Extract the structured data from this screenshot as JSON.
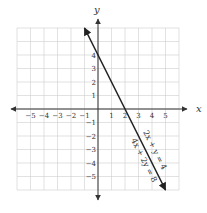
{
  "chart_data": {
    "type": "line",
    "title": "",
    "xlabel": "x",
    "ylabel": "y",
    "xlim": [
      -6,
      6
    ],
    "ylim": [
      -6,
      6
    ],
    "grid": true,
    "x_ticks": [
      -5,
      -4,
      -3,
      -2,
      -1,
      1,
      2,
      3,
      4,
      5
    ],
    "y_ticks": [
      -5,
      -4,
      -3,
      -2,
      -1,
      1,
      2,
      3,
      4
    ],
    "x_tick_labels": [
      "−5",
      "−4",
      "−3",
      "−2",
      "−1",
      "1",
      "2",
      "3",
      "4",
      "5"
    ],
    "y_tick_labels": [
      "−5",
      "−4",
      "−3",
      "−2",
      "−1",
      "1",
      "2",
      "3",
      "4"
    ],
    "series": [
      {
        "name": "2x + y = 4",
        "x": [
          -1,
          5
        ],
        "y": [
          6,
          -6
        ],
        "color": "#222222"
      },
      {
        "name": "4x + 2y = 8",
        "x": [
          -1,
          5
        ],
        "y": [
          6,
          -6
        ],
        "color": "#222222"
      }
    ],
    "annotations": [
      "2x + y = 4",
      "4x + 2y = 8"
    ]
  },
  "colors": {
    "grid": "#cfcfcf",
    "axis": "#333333",
    "line": "#222222"
  }
}
